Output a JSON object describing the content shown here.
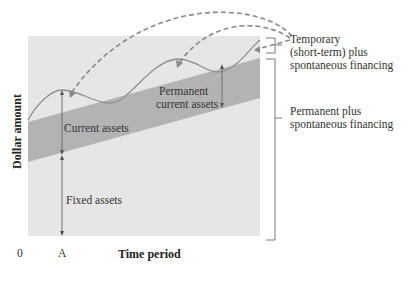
{
  "diagram": {
    "y_axis_label": "Dollar amount",
    "x_axis_label": "Time period",
    "x_origin_label": "0",
    "x_marker_label": "A",
    "regions": {
      "current_assets": "Current assets",
      "fixed_assets": "Fixed assets",
      "permanent_current_line1": "Permanent",
      "permanent_current_line2": "current assets"
    },
    "financing": {
      "temporary_line1": "Temporary",
      "temporary_line2": "(short-term) plus",
      "temporary_line3": "spontaneous financing",
      "permanent_line1": "Permanent plus",
      "permanent_line2": "spontaneous financing"
    },
    "colors": {
      "background_fill": "#e6e6e6",
      "permanent_current_band": "#b3b3b3",
      "curve": "#909090",
      "dashed_arrows": "#888888",
      "bracket": "#7a7a7a"
    }
  }
}
